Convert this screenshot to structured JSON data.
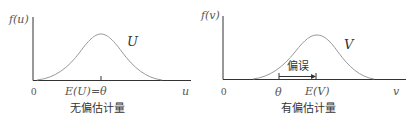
{
  "left_panel": {
    "y_axis_label": "f(u)",
    "curve_label": "U",
    "origin_label": "0",
    "mean_label": "E(U)=θ",
    "x_axis_label": "u",
    "caption": "无偏估计量"
  },
  "right_panel": {
    "y_axis_label": "f(v)",
    "curve_label": "V",
    "origin_label": "0",
    "theta_label": "θ",
    "mean_label": "E(V)",
    "x_axis_label": "v",
    "bias_label": "偏误",
    "caption": "有偏估计量"
  },
  "colors": {
    "axis": "#333333",
    "curve": "#888888",
    "text": "#555555"
  }
}
